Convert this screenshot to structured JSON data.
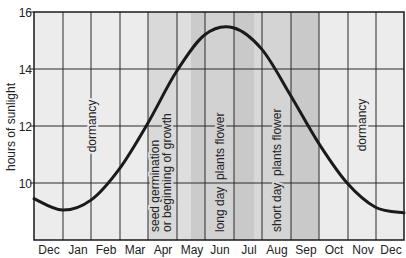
{
  "chart_data": {
    "type": "line",
    "title": "",
    "xlabel": "",
    "ylabel": "hours of sunlight",
    "ylim": [
      8,
      16
    ],
    "yticks": [
      "10",
      "12",
      "14",
      "16"
    ],
    "grid": true,
    "categories": [
      "Dec",
      "Jan",
      "Feb",
      "Mar",
      "Apr",
      "May",
      "Jun",
      "Jul",
      "Aug",
      "Sep",
      "Oct",
      "Nov",
      "Dec"
    ],
    "series": [
      {
        "name": "hours of sunlight",
        "x": [
          0,
          1,
          2,
          3,
          4,
          5,
          6,
          7,
          8,
          9,
          10,
          11,
          12,
          13
        ],
        "values": [
          9.45,
          9.05,
          9.4,
          10.5,
          12.1,
          13.9,
          15.2,
          15.45,
          14.7,
          13.1,
          11.4,
          10.0,
          9.15,
          8.95
        ]
      }
    ],
    "annotations": [
      {
        "text": "dormancy",
        "month_span": [
          "Jan"
        ]
      },
      {
        "text": "seed germination",
        "text2": "or beginning of growth",
        "month_span": [
          "Apr"
        ]
      },
      {
        "text": "long day  plants flower",
        "month_span": [
          "May",
          "Jul"
        ]
      },
      {
        "text": "short day  plants flower",
        "month_span": [
          "Aug",
          "Sep"
        ]
      },
      {
        "text": "dormancy",
        "month_span": [
          "Nov"
        ]
      }
    ],
    "bands_colors": {
      "background": "#ebebeb",
      "growth": "#d9d9d9",
      "long_day_light": "#dcdcdc",
      "long_day": "#cfcfcf",
      "long_day_dark": "#c6c6c6",
      "short_day": "#d2d2d2",
      "short_day_dark": "#c8c8c8",
      "curve": "#1a1a1a"
    }
  }
}
